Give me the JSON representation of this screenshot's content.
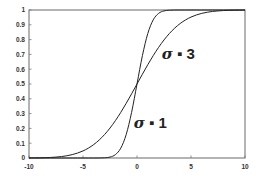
{
  "chart_data": {
    "type": "line",
    "title": "",
    "xlabel": "",
    "ylabel": "",
    "xlim": [
      -10,
      10
    ],
    "ylim": [
      0,
      1
    ],
    "grid": false,
    "legend": "none",
    "x_ticks": [
      "-10",
      "-5",
      "0",
      "5",
      "10"
    ],
    "y_ticks": [
      "0",
      "0.1",
      "0.2",
      "0.3",
      "0.4",
      "0.5",
      "0.6",
      "0.7",
      "0.8",
      "0.9",
      "1"
    ],
    "x": [
      -10,
      -9.5,
      -9,
      -8.5,
      -8,
      -7.5,
      -7,
      -6.5,
      -6,
      -5.5,
      -5,
      -4.5,
      -4,
      -3.5,
      -3,
      -2.5,
      -2,
      -1.5,
      -1,
      -0.5,
      0,
      0.5,
      1,
      1.5,
      2,
      2.5,
      3,
      3.5,
      4,
      4.5,
      5,
      5.5,
      6,
      6.5,
      7,
      7.5,
      8,
      8.5,
      9,
      9.5,
      10
    ],
    "series": [
      {
        "name": "σ = 1",
        "values": [
          0,
          0,
          0,
          0,
          0,
          0,
          0,
          0,
          0,
          0,
          0,
          0,
          0,
          0.0002,
          0.0013,
          0.0062,
          0.0228,
          0.0668,
          0.1587,
          0.3085,
          0.5,
          0.6915,
          0.8413,
          0.9332,
          0.9772,
          0.9938,
          0.9987,
          0.9998,
          1,
          1,
          1,
          1,
          1,
          1,
          1,
          1,
          1,
          1,
          1,
          1,
          1
        ]
      },
      {
        "name": "σ = 3",
        "values": [
          0.0004,
          0.0008,
          0.0013,
          0.0023,
          0.0038,
          0.0062,
          0.0098,
          0.0151,
          0.0228,
          0.0334,
          0.0478,
          0.0668,
          0.0912,
          0.1217,
          0.1587,
          0.2023,
          0.2525,
          0.3085,
          0.3694,
          0.4338,
          0.5,
          0.5662,
          0.6306,
          0.6915,
          0.7475,
          0.7977,
          0.8413,
          0.8783,
          0.9088,
          0.9332,
          0.9522,
          0.9666,
          0.9772,
          0.9849,
          0.9902,
          0.9938,
          0.9962,
          0.9977,
          0.9987,
          0.9992,
          0.9996
        ]
      }
    ],
    "annotations": [
      {
        "symbol": "σ",
        "text": " ▪ 3",
        "x": 2.3,
        "y": 0.67
      },
      {
        "symbol": "σ",
        "text": " ▪ 1",
        "x": -0.3,
        "y": 0.2
      }
    ]
  }
}
